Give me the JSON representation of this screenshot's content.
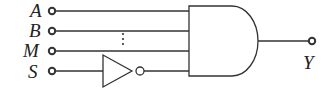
{
  "diagram": {
    "type": "logic-circuit",
    "inputs": [
      {
        "label": "A",
        "y": 11
      },
      {
        "label": "B",
        "y": 31
      },
      {
        "label": "M",
        "y": 51
      },
      {
        "label": "S",
        "y": 71
      }
    ],
    "ellipsis": "⋮",
    "not_gate": {
      "input": "S"
    },
    "and_gate": {
      "inputs": [
        "A",
        "B",
        "...",
        "M",
        "NOT S"
      ]
    },
    "output": {
      "label": "Y"
    },
    "colors": {
      "stroke": "#333333",
      "background": "#ffffff"
    }
  }
}
